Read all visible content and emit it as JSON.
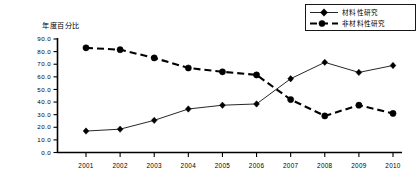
{
  "chart_data": {
    "type": "line",
    "title": "",
    "ylabel": "年度百分比",
    "xlabel": "",
    "categories": [
      "2001",
      "2002",
      "2003",
      "2004",
      "2005",
      "2006",
      "2007",
      "2008",
      "2009",
      "2010"
    ],
    "ylim": [
      0,
      90
    ],
    "ytick_labels": [
      "90.0",
      "80.0",
      "70.0",
      "60.0",
      "50.0",
      "40.0",
      "30.0",
      "20.0",
      "10.0",
      "0.0"
    ],
    "ytick_values": [
      90,
      80,
      70,
      60,
      50,
      40,
      30,
      20,
      10,
      0
    ],
    "grid": false,
    "legend_position": "top-right",
    "series": [
      {
        "name": "材料性研究",
        "marker": "diamond",
        "line_style": "solid",
        "color": "#000000",
        "values": [
          17.0,
          18.5,
          25.5,
          34.5,
          37.5,
          38.5,
          58.5,
          71.5,
          63.5,
          69.0
        ]
      },
      {
        "name": "非材料性研究",
        "marker": "circle",
        "line_style": "dashed",
        "color": "#000000",
        "values": [
          83.0,
          81.5,
          75.0,
          67.0,
          64.0,
          61.5,
          42.0,
          29.0,
          37.5,
          31.0
        ]
      }
    ]
  },
  "legend": {
    "entries": [
      {
        "label": "材料性研究"
      },
      {
        "label": "非材料性研究"
      }
    ]
  },
  "axis": {
    "y_title": "年度百分比"
  }
}
